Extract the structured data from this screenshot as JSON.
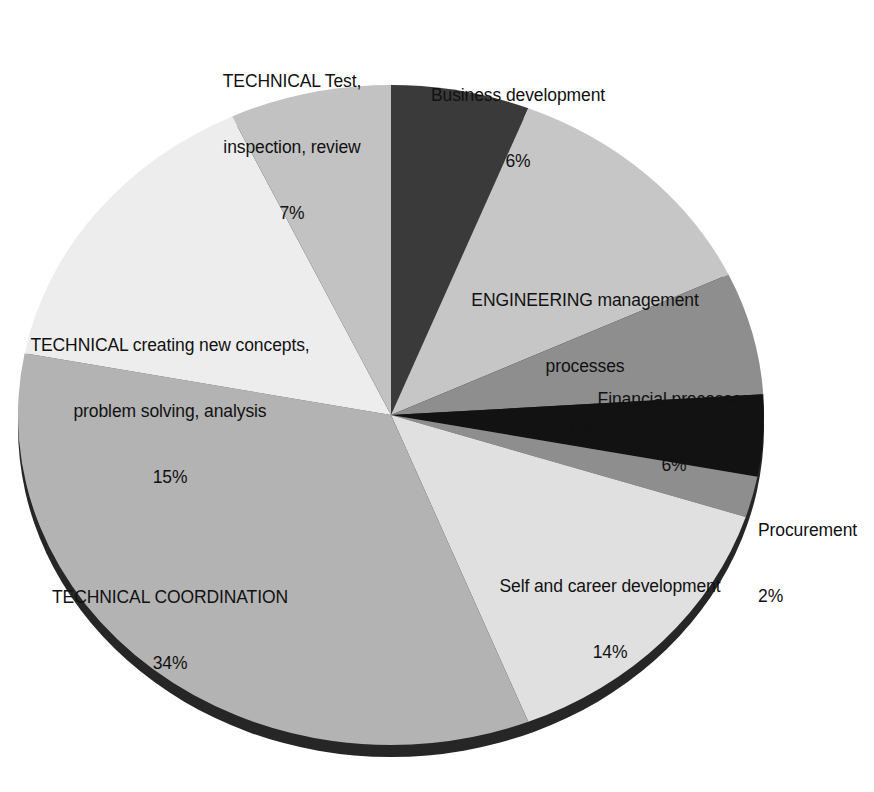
{
  "chart_data": {
    "type": "pie",
    "title": "",
    "subtitle": "",
    "xlabel": "",
    "ylabel": "",
    "legend_position": "none",
    "grid": false,
    "value_unit": "%",
    "start_angle_deg": 0,
    "direction": "clockwise",
    "style": "3d-elliptical",
    "categories": [
      "Business development",
      "ENGINEERING management processes",
      "Financial processes",
      "",
      "Procurement",
      "Self and career development",
      "TECHNICAL COORDINATION",
      "TECHNICAL creating new concepts, problem solving, analysis",
      "TECHNICAL Test, inspection, review"
    ],
    "values": [
      6,
      12,
      6,
      4,
      2,
      14,
      34,
      15,
      7
    ],
    "slices": [
      {
        "label": "Business development",
        "value": 6,
        "value_label": "6%",
        "color": "#3a3a3a"
      },
      {
        "label": "ENGINEERING management processes",
        "value": 12,
        "value_label": "12%",
        "color": "#c6c6c6"
      },
      {
        "label": "Financial processes",
        "value": 6,
        "value_label": "6%",
        "color": "#8e8e8e"
      },
      {
        "label": "",
        "value": 4,
        "value_label": "",
        "color": "#121212"
      },
      {
        "label": "Procurement",
        "value": 2,
        "value_label": "2%",
        "color": "#8e8e8e"
      },
      {
        "label": "Self and career development",
        "value": 14,
        "value_label": "14%",
        "color": "#e0e0e0"
      },
      {
        "label": "TECHNICAL COORDINATION",
        "value": 34,
        "value_label": "34%",
        "color": "#b3b3b3"
      },
      {
        "label": "TECHNICAL creating new concepts, problem solving, analysis",
        "value": 15,
        "value_label": "15%",
        "color": "#ededed"
      },
      {
        "label": "TECHNICAL Test, inspection, review",
        "value": 7,
        "value_label": "7%",
        "color": "#c2c2c2"
      }
    ]
  },
  "labels": {
    "technical_test": {
      "line1": "TECHNICAL Test,",
      "line2": "inspection, review",
      "percent": "7%"
    },
    "business_development": {
      "line1": "Business development",
      "percent": "6%"
    },
    "engineering_management": {
      "line1": "ENGINEERING management",
      "line2": "processes",
      "percent": "12%"
    },
    "financial_processes": {
      "line1": "Financial processes",
      "percent": "6%"
    },
    "procurement": {
      "line1": "Procurement",
      "percent": "2%"
    },
    "self_career_development": {
      "line1": "Self and career development",
      "percent": "14%"
    },
    "technical_coordination": {
      "line1": "TECHNICAL COORDINATION",
      "percent": "34%"
    },
    "technical_creating": {
      "line1": "TECHNICAL creating new concepts,",
      "line2": "problem solving, analysis",
      "percent": "15%"
    }
  },
  "colors": {
    "background": "#ffffff",
    "text": "#111111",
    "pie_side_shadow": "#2a2a2a",
    "slice_outline": "none"
  }
}
